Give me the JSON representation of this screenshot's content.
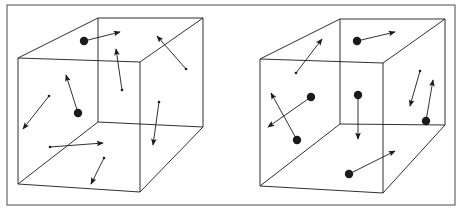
{
  "figure": {
    "colors": {
      "background": "#ffffff",
      "ink": "#1a1a1a",
      "frame": "#6a6a6a"
    },
    "frame": {
      "x": 7,
      "y": 5,
      "w": 448,
      "h": 200
    }
  },
  "cubes": [
    {
      "name": "left-cube",
      "front": [
        [
          18,
          58
        ],
        [
          140,
          62
        ],
        [
          140,
          192
        ],
        [
          18,
          184
        ]
      ],
      "back": [
        [
          98,
          18
        ],
        [
          203,
          18
        ],
        [
          203,
          127
        ],
        [
          98,
          122
        ]
      ],
      "particles": [
        {
          "size": "large",
          "from": [
            84,
            41
          ],
          "to": [
            120,
            32
          ]
        },
        {
          "size": "small",
          "from": [
            122,
            90
          ],
          "to": [
            116,
            49
          ]
        },
        {
          "size": "small",
          "from": [
            186,
            69
          ],
          "to": [
            157,
            36
          ]
        },
        {
          "size": "large",
          "from": [
            78,
            113
          ],
          "to": [
            66,
            75
          ]
        },
        {
          "size": "small",
          "from": [
            49,
            96
          ],
          "to": [
            23,
            129
          ]
        },
        {
          "size": "small",
          "from": [
            159,
            102
          ],
          "to": [
            153,
            145
          ]
        },
        {
          "size": "small",
          "from": [
            50,
            147
          ],
          "to": [
            103,
            143
          ]
        },
        {
          "size": "small",
          "from": [
            104,
            158
          ],
          "to": [
            91,
            184
          ]
        }
      ]
    },
    {
      "name": "right-cube",
      "front": [
        [
          260,
          59
        ],
        [
          383,
          63
        ],
        [
          383,
          193
        ],
        [
          260,
          186
        ]
      ],
      "back": [
        [
          340,
          19
        ],
        [
          445,
          19
        ],
        [
          445,
          125
        ],
        [
          340,
          124
        ]
      ],
      "particles": [
        {
          "size": "large",
          "from": [
            357,
            41
          ],
          "to": [
            395,
            32
          ]
        },
        {
          "size": "small",
          "from": [
            296,
            73
          ],
          "to": [
            322,
            39
          ]
        },
        {
          "size": "large",
          "from": [
            311,
            97
          ],
          "to": [
            268,
            127
          ]
        },
        {
          "size": "large",
          "from": [
            297,
            140
          ],
          "to": [
            271,
            93
          ]
        },
        {
          "size": "large",
          "from": [
            358,
            95
          ],
          "to": [
            358,
            139
          ]
        },
        {
          "size": "small",
          "from": [
            420,
            71
          ],
          "to": [
            410,
            106
          ]
        },
        {
          "size": "large",
          "from": [
            426,
            121
          ],
          "to": [
            433,
            80
          ]
        },
        {
          "size": "large",
          "from": [
            349,
            174
          ],
          "to": [
            395,
            151
          ]
        }
      ]
    }
  ]
}
